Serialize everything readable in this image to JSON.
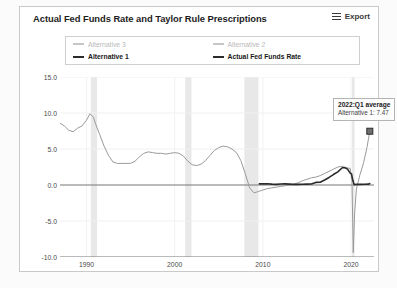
{
  "header": {
    "title": "Actual Fed Funds Rate and Taylor Rule Prescriptions",
    "export_label": "Export",
    "menu_icon": "hamburger-icon"
  },
  "legend": {
    "items": [
      {
        "label": "Alternative 3",
        "active": false,
        "color": "#c6c6c6"
      },
      {
        "label": "Alternative 2",
        "active": false,
        "color": "#c6c6c6"
      },
      {
        "label": "Alternative 1",
        "active": true,
        "color": "#9a9a9a"
      },
      {
        "label": "Actual Fed Funds Rate",
        "active": true,
        "color": "#2b2b2b"
      }
    ]
  },
  "annotation": {
    "title": "2022:Q1 average",
    "detail": "Alternative 1: 7.47",
    "marker_x": 2022.125,
    "marker_y": 7.47
  },
  "chart_data": {
    "type": "line",
    "title": "Actual Fed Funds Rate and Taylor Rule Prescriptions",
    "xlabel": "",
    "ylabel": "",
    "xlim": [
      1987.0,
      2022.6
    ],
    "ylim": [
      -10.0,
      15.0
    ],
    "grid": true,
    "legend_position": "top",
    "ytick_labels": [
      "15.0",
      "10.0",
      "5.0",
      "0.0",
      "-5.0",
      "-10.0"
    ],
    "yticks": [
      15.0,
      10.0,
      5.0,
      0.0,
      -5.0,
      -10.0
    ],
    "xtick_labels": [
      "1990",
      "2000",
      "2010",
      "2020"
    ],
    "xticks": [
      1990,
      2000,
      2010,
      2020
    ],
    "zero_line": 0.0,
    "recession_bands": [
      {
        "start": 1990.5,
        "end": 1991.2
      },
      {
        "start": 2001.2,
        "end": 2001.9
      },
      {
        "start": 2007.9,
        "end": 2009.5
      },
      {
        "start": 2020.1,
        "end": 2020.4
      }
    ],
    "series": [
      {
        "name": "Alternative 1",
        "color": "#9a9a9a",
        "width": 1.0,
        "points": [
          [
            1987.0,
            8.6
          ],
          [
            1987.5,
            8.2
          ],
          [
            1988.0,
            7.6
          ],
          [
            1988.5,
            7.4
          ],
          [
            1989.0,
            7.9
          ],
          [
            1989.5,
            8.2
          ],
          [
            1990.0,
            9.0
          ],
          [
            1990.4,
            9.9
          ],
          [
            1990.8,
            9.4
          ],
          [
            1991.0,
            8.6
          ],
          [
            1991.5,
            7.0
          ],
          [
            1992.0,
            5.4
          ],
          [
            1992.5,
            4.1
          ],
          [
            1993.0,
            3.2
          ],
          [
            1993.5,
            3.0
          ],
          [
            1994.0,
            3.0
          ],
          [
            1994.5,
            3.0
          ],
          [
            1995.0,
            3.0
          ],
          [
            1995.5,
            3.3
          ],
          [
            1996.0,
            3.9
          ],
          [
            1996.5,
            4.4
          ],
          [
            1997.0,
            4.6
          ],
          [
            1997.5,
            4.5
          ],
          [
            1998.0,
            4.4
          ],
          [
            1998.5,
            4.4
          ],
          [
            1999.0,
            4.3
          ],
          [
            1999.5,
            4.4
          ],
          [
            2000.0,
            4.5
          ],
          [
            2000.5,
            4.4
          ],
          [
            2001.0,
            4.0
          ],
          [
            2001.5,
            3.3
          ],
          [
            2002.0,
            2.8
          ],
          [
            2002.5,
            2.7
          ],
          [
            2003.0,
            2.9
          ],
          [
            2003.5,
            3.4
          ],
          [
            2004.0,
            4.1
          ],
          [
            2004.5,
            4.8
          ],
          [
            2005.0,
            5.2
          ],
          [
            2005.5,
            5.4
          ],
          [
            2006.0,
            5.3
          ],
          [
            2006.5,
            5.0
          ],
          [
            2007.0,
            4.5
          ],
          [
            2007.5,
            3.4
          ],
          [
            2008.0,
            1.6
          ],
          [
            2008.5,
            -0.4
          ],
          [
            2009.0,
            -1.1
          ],
          [
            2009.5,
            -0.9
          ],
          [
            2010.0,
            -0.7
          ],
          [
            2010.5,
            -0.5
          ],
          [
            2011.0,
            -0.4
          ],
          [
            2011.5,
            -0.3
          ],
          [
            2012.0,
            -0.2
          ],
          [
            2012.5,
            -0.1
          ],
          [
            2013.0,
            0.0
          ],
          [
            2013.5,
            0.1
          ],
          [
            2014.0,
            0.3
          ],
          [
            2014.5,
            0.6
          ],
          [
            2015.0,
            0.8
          ],
          [
            2015.5,
            1.0
          ],
          [
            2016.0,
            1.1
          ],
          [
            2016.5,
            1.3
          ],
          [
            2017.0,
            1.6
          ],
          [
            2017.5,
            1.9
          ],
          [
            2018.0,
            2.2
          ],
          [
            2018.5,
            2.5
          ],
          [
            2019.0,
            2.6
          ],
          [
            2019.5,
            2.4
          ],
          [
            2019.9,
            2.3
          ],
          [
            2020.1,
            0.6
          ],
          [
            2020.25,
            -9.4
          ],
          [
            2020.4,
            -4.0
          ],
          [
            2020.6,
            -0.6
          ],
          [
            2021.0,
            1.4
          ],
          [
            2021.4,
            3.0
          ],
          [
            2021.8,
            5.2
          ],
          [
            2022.125,
            7.47
          ]
        ]
      },
      {
        "name": "Actual Fed Funds Rate",
        "color": "#2b2b2b",
        "width": 1.6,
        "points": [
          [
            2009.6,
            0.15
          ],
          [
            2010.0,
            0.15
          ],
          [
            2010.5,
            0.18
          ],
          [
            2011.0,
            0.12
          ],
          [
            2011.5,
            0.08
          ],
          [
            2012.0,
            0.14
          ],
          [
            2012.5,
            0.15
          ],
          [
            2013.0,
            0.12
          ],
          [
            2013.5,
            0.09
          ],
          [
            2014.0,
            0.08
          ],
          [
            2014.5,
            0.1
          ],
          [
            2015.0,
            0.12
          ],
          [
            2015.5,
            0.14
          ],
          [
            2016.0,
            0.36
          ],
          [
            2016.5,
            0.39
          ],
          [
            2017.0,
            0.7
          ],
          [
            2017.5,
            1.05
          ],
          [
            2018.0,
            1.45
          ],
          [
            2018.5,
            1.82
          ],
          [
            2019.0,
            2.4
          ],
          [
            2019.3,
            2.4
          ],
          [
            2019.6,
            2.2
          ],
          [
            2019.9,
            1.65
          ],
          [
            2020.05,
            1.55
          ],
          [
            2020.2,
            0.65
          ],
          [
            2020.35,
            0.05
          ],
          [
            2020.6,
            0.09
          ],
          [
            2021.0,
            0.08
          ],
          [
            2021.5,
            0.1
          ],
          [
            2022.0,
            0.12
          ],
          [
            2022.125,
            0.2
          ]
        ]
      }
    ],
    "recent_actual_detail": {
      "note": "dark line begins near 2009 just above zero, rises through 2016-2019, drops in 2020"
    }
  }
}
